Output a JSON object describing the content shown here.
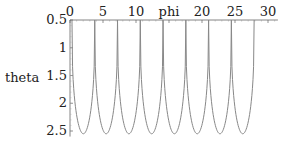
{
  "chart_data": {
    "type": "line",
    "title": "",
    "xlabel": "phi",
    "ylabel": "theta",
    "xlim": [
      0,
      31.5
    ],
    "ylim": [
      0.5,
      2.6
    ],
    "y_inverted": true,
    "x_axis_position": "top",
    "x_ticks": [
      0,
      5,
      10,
      15,
      20,
      25,
      30
    ],
    "x_tick_labels": [
      "0",
      "5",
      "10",
      "phi",
      "20",
      "25",
      "30"
    ],
    "y_ticks": [
      0.5,
      1,
      1.5,
      2,
      2.5
    ],
    "y_tick_labels": [
      "0.5",
      "1",
      "1.5",
      "2",
      "2.5"
    ],
    "grid": false,
    "legend": null,
    "series": [
      {
        "name": "theta(phi)",
        "color": "#888888",
        "description": "periodic cusped curve: sharp cusps reaching theta=0.5 and rounded troughs at theta~2.55",
        "cusp_phi": [
          0.3,
          3.75,
          7.2,
          10.65,
          14.1,
          17.55,
          21.0,
          24.45,
          27.9
        ],
        "trough_phi": [
          2.0,
          5.45,
          8.9,
          12.35,
          15.8,
          19.25,
          22.7,
          26.15
        ],
        "min_theta": 0.5,
        "max_theta": 2.55
      }
    ]
  },
  "labels": {
    "xlabel": "phi",
    "ylabel": "theta"
  }
}
